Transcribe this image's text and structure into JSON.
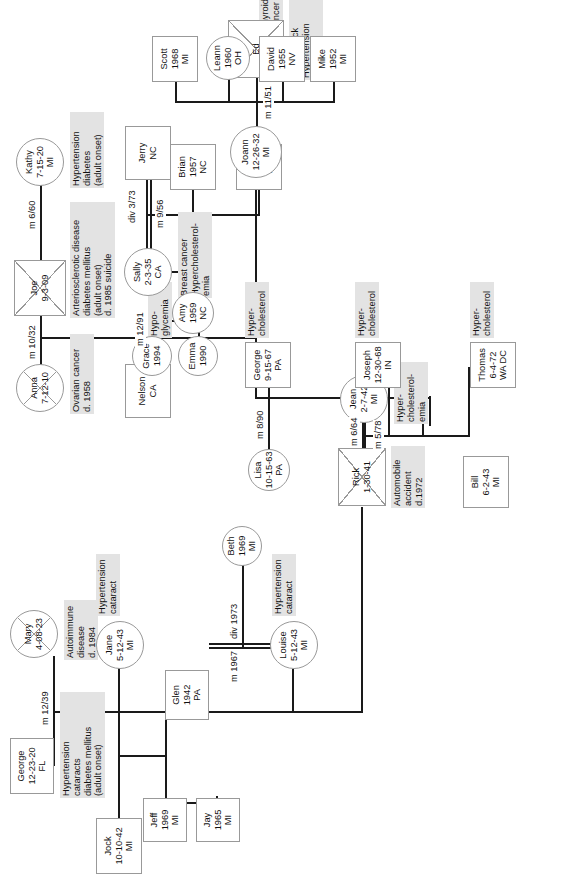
{
  "orientation": "rotated-90-ccw",
  "legend": {
    "male_shape": "square",
    "female_shape": "circle",
    "deceased_marker": "diagonal-cross"
  },
  "people": {
    "george_sr": {
      "name": "George",
      "dob": "12-23-20",
      "place": "FL",
      "sex": "male",
      "deceased": false
    },
    "mary": {
      "name": "Mary",
      "dob": "4-08-23",
      "place": "",
      "sex": "female",
      "deceased": true
    },
    "jock": {
      "name": "Jock",
      "dob": "10-10-42",
      "place": "MI",
      "sex": "male",
      "deceased": false
    },
    "jane": {
      "name": "Jane",
      "dob": "5-12-43",
      "place": "MI",
      "sex": "female",
      "deceased": false
    },
    "jeff": {
      "name": "Jeff",
      "dob": "1969",
      "place": "MI",
      "sex": "male",
      "deceased": false
    },
    "jay": {
      "name": "Jay",
      "dob": "1965",
      "place": "MI",
      "sex": "male",
      "deceased": false
    },
    "glen": {
      "name": "Glen",
      "dob": "1942",
      "place": "PA",
      "sex": "male",
      "deceased": false
    },
    "louise": {
      "name": "Louise",
      "dob": "5-12-43",
      "place": "MI",
      "sex": "female",
      "deceased": false
    },
    "beth": {
      "name": "Beth",
      "dob": "1969",
      "place": "MI",
      "sex": "female",
      "deceased": false
    },
    "rick": {
      "name": "Rick",
      "dob": "1-30-41",
      "place": "",
      "sex": "male",
      "deceased": true
    },
    "jean": {
      "name": "Jean",
      "dob": "2-7-42",
      "place": "MI",
      "sex": "female",
      "deceased": false
    },
    "bill": {
      "name": "Bill",
      "dob": "6-2-43",
      "place": "MI",
      "sex": "male",
      "deceased": false
    },
    "thomas": {
      "name": "Thomas",
      "dob": "6-4-72",
      "place": "WA DC",
      "sex": "male",
      "deceased": false
    },
    "joseph": {
      "name": "Joseph",
      "dob": "12-30-68",
      "place": "IN",
      "sex": "male",
      "deceased": false
    },
    "george_jr": {
      "name": "George",
      "dob": "9-15-67",
      "place": "PA",
      "sex": "male",
      "deceased": false
    },
    "lisa": {
      "name": "Lisa",
      "dob": "10-15-63",
      "place": "PA",
      "sex": "female",
      "deceased": false
    },
    "anna": {
      "name": "Anna",
      "dob": "7-12-10",
      "place": "",
      "sex": "female",
      "deceased": true
    },
    "joe": {
      "name": "Joe",
      "dob": "9-3-09",
      "place": "",
      "sex": "male",
      "deceased": true
    },
    "kathy": {
      "name": "Kathy",
      "dob": "7-15-20",
      "place": "MI",
      "sex": "female",
      "deceased": false
    },
    "nelson": {
      "name": "Nelson",
      "dob": "",
      "place": "CA",
      "sex": "male",
      "deceased": false
    },
    "sally": {
      "name": "Sally",
      "dob": "2-3-35",
      "place": "CA",
      "sex": "female",
      "deceased": false
    },
    "jerry": {
      "name": "Jerry",
      "dob": "",
      "place": "NC",
      "sex": "male",
      "deceased": false
    },
    "amy": {
      "name": "Amy",
      "dob": "1959",
      "place": "NC",
      "sex": "female",
      "deceased": false
    },
    "brian": {
      "name": "Brian",
      "dob": "1957",
      "place": "NC",
      "sex": "male",
      "deceased": false
    },
    "will": {
      "name": "Will",
      "dob": "1959",
      "place": "NC",
      "sex": "male",
      "deceased": false
    },
    "grace": {
      "name": "Grace",
      "dob": "1994",
      "place": "",
      "sex": "female",
      "deceased": false
    },
    "emma": {
      "name": "Emma",
      "dob": "1990",
      "place": "",
      "sex": "female",
      "deceased": false
    },
    "joann": {
      "name": "Joann",
      "dob": "12-26-32",
      "place": "MI",
      "sex": "female",
      "deceased": false
    },
    "ed": {
      "name": "Ed",
      "dob": "",
      "place": "",
      "sex": "male",
      "deceased": true
    },
    "scott": {
      "name": "Scott",
      "dob": "1968",
      "place": "MI",
      "sex": "male",
      "deceased": false
    },
    "leann": {
      "name": "Leann",
      "dob": "1960",
      "place": "OH",
      "sex": "female",
      "deceased": false
    },
    "david": {
      "name": "David",
      "dob": "1955",
      "place": "NV",
      "sex": "male",
      "deceased": false
    },
    "mike": {
      "name": "Mike",
      "dob": "1952",
      "place": "MI",
      "sex": "male",
      "deceased": false
    }
  },
  "notes": {
    "george_sr": "Hypertension\ncataracts\ndiabetes mellitus\n(adult onset)",
    "mary": "Autoimmune\ndisease\nd. 1984",
    "jane": "Hypertension\ncataract",
    "louise": "Hypertension\ncataract",
    "rick": "Automobile\naccident\nd.1972",
    "jean": "Hyper-\ncholesterol-\nemia",
    "thomas": "Hyper-\ncholesterol",
    "joseph": "Hyper-\ncholesterol",
    "george_jr": "Hyper-\ncholesterol",
    "lisa": "Hypo-\nglycemia",
    "anna": "Ovarian cancer\nd. 1958",
    "joe": "Arteriosclerotic disease\ndiabetes mellitus\n(adult onset)\nd. 1985 suicide",
    "kathy": "Hypertension\ndiabetes\n(adult onset)",
    "sally": "Breast cancer\nHypercholesterol-\nemia",
    "david": "Thyroid\ncancer",
    "ed": "Heart attack\nHypertension\nd. 1983"
  },
  "unions": {
    "george_mary": {
      "marriage": "m 12/39",
      "divorce": ""
    },
    "jock_jane": {
      "marriage": "",
      "divorce": ""
    },
    "glen_louise": {
      "marriage": "m 1967",
      "divorce": "div 1973"
    },
    "rick_jean": {
      "marriage": "m 6/64",
      "divorce": ""
    },
    "jean_bill": {
      "marriage": "m 5/78",
      "divorce": ""
    },
    "georgejr_lisa": {
      "marriage": "m 8/90",
      "divorce": ""
    },
    "joe_anna": {
      "marriage": "m 10/32",
      "divorce": ""
    },
    "joe_kathy": {
      "marriage": "m 6/60",
      "divorce": ""
    },
    "nelson_sally": {
      "marriage": "m 12/91",
      "divorce": ""
    },
    "sally_jerry": {
      "marriage": "m 9/56",
      "divorce": "div 3/73"
    },
    "joann_ed": {
      "marriage": "m 11/51",
      "divorce": ""
    }
  }
}
